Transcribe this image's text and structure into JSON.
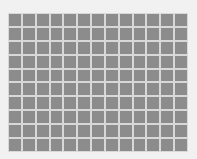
{
  "image": {
    "subject": "gray grid pattern",
    "grid": {
      "columns": 13,
      "rows": 10
    },
    "colors": {
      "background": "#f1f1f1",
      "cell": "#8c8c8c",
      "grid_line": "#d8d8d8"
    }
  }
}
